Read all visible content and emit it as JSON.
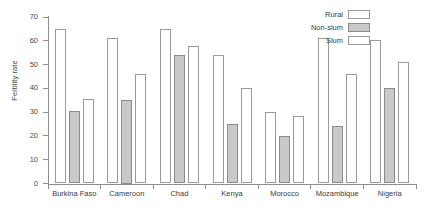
{
  "chart_data": {
    "type": "bar",
    "title": "",
    "xlabel": "",
    "ylabel": "Fertility rate",
    "ylim": [
      0,
      70
    ],
    "yticks": [
      0,
      10,
      20,
      30,
      40,
      50,
      60,
      70
    ],
    "ytick_labels": [
      "0",
      "10",
      "20",
      "30",
      "40",
      "50",
      "60",
      "70"
    ],
    "grid": false,
    "legend_position": "top-right",
    "legend": [
      "Rural",
      "Non-slum",
      "Slum"
    ],
    "categories": [
      "Burkina Faso",
      "Cameroon",
      "Chad",
      "Kenya",
      "Morocco",
      "Mozambique",
      "Nigeria"
    ],
    "series": [
      {
        "name": "Rural",
        "fill": "#ffffff",
        "values": [
          65.0,
          61.0,
          65.0,
          54.0,
          30.0,
          61.0,
          60.5
        ]
      },
      {
        "name": "Non-slum",
        "fill": "#c9c9c9",
        "values": [
          30.5,
          35.0,
          54.0,
          25.0,
          20.0,
          24.0,
          40.0
        ]
      },
      {
        "name": "Slum",
        "fill": "#ffffff",
        "values": [
          35.5,
          46.0,
          58.0,
          40.0,
          28.5,
          46.0,
          51.0
        ]
      }
    ]
  },
  "axis": {
    "y_title": "Fertility rate"
  },
  "colors": {
    "axis": "#8e8e8e",
    "bar_outline": "#9a9a9a",
    "bar_fill_empty": "#ffffff",
    "bar_fill_gray": "#c9c9c9",
    "text": "#3a3a3a"
  }
}
